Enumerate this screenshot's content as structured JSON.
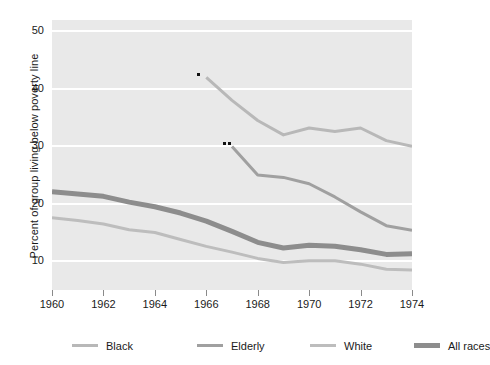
{
  "chart_data": {
    "type": "line",
    "title": "",
    "xlabel": "",
    "ylabel": "Percent of group living below poverty line",
    "xlim": [
      1960,
      1974
    ],
    "ylim": [
      5,
      52
    ],
    "yticks": [
      10,
      20,
      30,
      40,
      50
    ],
    "xticks": [
      1960,
      1962,
      1964,
      1966,
      1968,
      1970,
      1972,
      1974
    ],
    "grid": "horizontal-white",
    "legend_position": "bottom",
    "plot_background": "#e9e9e9",
    "series": [
      {
        "name": "Black",
        "color": "#b8b8b8",
        "width": 3,
        "marker_note": "*",
        "x": [
          1966,
          1967,
          1968,
          1969,
          1970,
          1971,
          1972,
          1973,
          1974
        ],
        "values": [
          42.0,
          38.0,
          34.5,
          32.0,
          33.2,
          32.6,
          33.2,
          31.0,
          30.0
        ]
      },
      {
        "name": "Elderly",
        "color": "#a0a0a0",
        "width": 3,
        "marker_note": "**",
        "x": [
          1967,
          1968,
          1969,
          1970,
          1971,
          1972,
          1973,
          1974
        ],
        "values": [
          30.0,
          25.0,
          24.6,
          23.5,
          21.2,
          18.6,
          16.2,
          15.4
        ]
      },
      {
        "name": "White",
        "color": "#bdbdbd",
        "width": 3,
        "x": [
          1960,
          1961,
          1962,
          1963,
          1964,
          1965,
          1966,
          1967,
          1968,
          1969,
          1970,
          1971,
          1972,
          1973,
          1974
        ],
        "values": [
          17.6,
          17.1,
          16.5,
          15.5,
          15.0,
          13.8,
          12.6,
          11.6,
          10.5,
          9.8,
          10.1,
          10.1,
          9.5,
          8.6,
          8.5
        ]
      },
      {
        "name": "All races",
        "color": "#8d8d8d",
        "width": 5,
        "x": [
          1960,
          1961,
          1962,
          1963,
          1964,
          1965,
          1966,
          1967,
          1968,
          1969,
          1970,
          1971,
          1972,
          1973,
          1974
        ],
        "values": [
          22.1,
          21.7,
          21.3,
          20.3,
          19.5,
          18.4,
          17.0,
          15.2,
          13.3,
          12.3,
          12.8,
          12.6,
          12.0,
          11.2,
          11.3
        ]
      }
    ],
    "annotations": [
      {
        "label": "*",
        "x": 1966,
        "y": 42.0,
        "series": "Black"
      },
      {
        "label": "**",
        "x": 1967,
        "y": 30.0,
        "series": "Elderly"
      }
    ]
  },
  "legend": {
    "items": [
      {
        "label": "Black",
        "color": "#b8b8b8",
        "thickness": 3
      },
      {
        "label": "Elderly",
        "color": "#a0a0a0",
        "thickness": 3
      },
      {
        "label": "White",
        "color": "#bdbdbd",
        "thickness": 3
      },
      {
        "label": "All races",
        "color": "#8d8d8d",
        "thickness": 5
      }
    ]
  }
}
